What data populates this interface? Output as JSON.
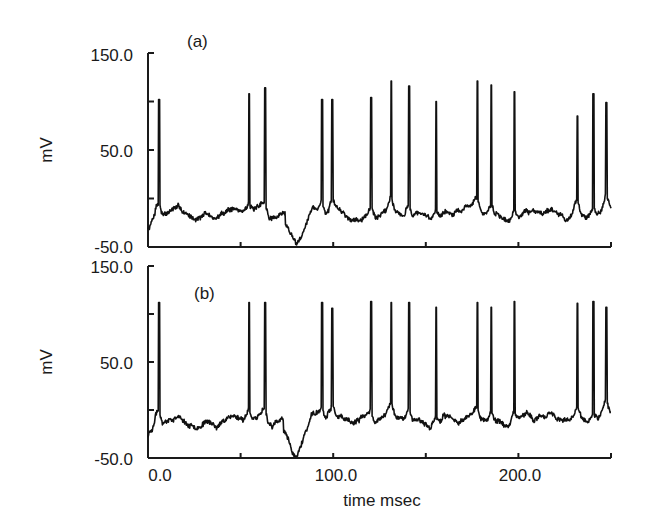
{
  "chart_data": [
    {
      "type": "line",
      "panel_label": "(a)",
      "title": "",
      "xlabel": "",
      "ylabel": "mV",
      "xlim": [
        0,
        250
      ],
      "ylim": [
        -50,
        150
      ],
      "yticks": [
        -50,
        0,
        50,
        100,
        150
      ],
      "ytick_labels": [
        "-50.0",
        "",
        "50.0",
        "",
        "150.0"
      ],
      "xticks": [
        0,
        50,
        100,
        150,
        200,
        250
      ],
      "xtick_labels": [],
      "grid": false,
      "legend": null,
      "series": [
        {
          "name": "membrane potential (a)",
          "baseline_mV": -15,
          "spike_times_ms": [
            6,
            54.6,
            63.2,
            94,
            99.5,
            120.5,
            131.4,
            141,
            155.7,
            177.8,
            185.4,
            197.8,
            231.9,
            240.5,
            247.5
          ],
          "spike_peaks_mV": [
            102,
            108,
            114,
            102,
            102,
            104,
            121,
            116,
            100,
            121,
            117,
            110,
            85,
            108,
            99
          ],
          "hyperpolarization": {
            "start_ms": 74,
            "end_ms": 86,
            "min_mV": -42
          }
        }
      ]
    },
    {
      "type": "line",
      "panel_label": "(b)",
      "title": "",
      "xlabel": "time msec",
      "ylabel": "mV",
      "xlim": [
        0,
        250
      ],
      "ylim": [
        -50,
        150
      ],
      "yticks": [
        -50,
        0,
        50,
        100,
        150
      ],
      "ytick_labels": [
        "-50.0",
        "",
        "50.0",
        "",
        "150.0"
      ],
      "xticks": [
        0,
        50,
        100,
        150,
        200,
        250
      ],
      "xtick_labels": [
        "0.0",
        "",
        "100.0",
        "",
        "200.0",
        ""
      ],
      "grid": false,
      "legend": null,
      "series": [
        {
          "name": "membrane potential (b)",
          "baseline_mV": -10,
          "spike_times_ms": [
            6,
            54.6,
            63.2,
            94,
            99.5,
            120.5,
            131.4,
            141,
            155.7,
            177.8,
            185.4,
            197.8,
            231.9,
            240.5,
            247.5
          ],
          "spike_peaks_mV": [
            112,
            112,
            112,
            112,
            106,
            113,
            112,
            112,
            107,
            112,
            107,
            113,
            111,
            113,
            107
          ],
          "hyperpolarization": {
            "start_ms": 73,
            "end_ms": 86,
            "min_mV": -48
          }
        }
      ]
    }
  ],
  "figure": {
    "panel_a_label": "(a)",
    "panel_b_label": "(b)",
    "ylabel_a": "mV",
    "ylabel_b": "mV",
    "xlabel": "time msec",
    "ytick_top_a": "150.0",
    "ytick_mid_a": "50.0",
    "ytick_bot_a": "-50.0",
    "ytick_top_b": "150.0",
    "ytick_mid_b": "50.0",
    "ytick_bot_b": "-50.0",
    "xtick_0": "0.0",
    "xtick_100": "100.0",
    "xtick_200": "200.0",
    "trace_color": "#111111",
    "axis_color": "#1a1a1a",
    "background": "#ffffff"
  }
}
